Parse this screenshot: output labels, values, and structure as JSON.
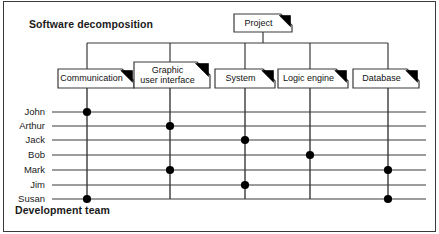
{
  "diagram": {
    "header_title": "Software decomposition",
    "footer_title": "Development team",
    "root": {
      "label": "Project"
    },
    "components": [
      {
        "label": "Communication"
      },
      {
        "label": "Graphic\nuser interface"
      },
      {
        "label": "System"
      },
      {
        "label": "Logic engine"
      },
      {
        "label": "Database"
      }
    ],
    "team": [
      {
        "label": "John"
      },
      {
        "label": "Arthur"
      },
      {
        "label": "Jack"
      },
      {
        "label": "Bob"
      },
      {
        "label": "Mark"
      },
      {
        "label": "Jim"
      },
      {
        "label": "Susan"
      }
    ],
    "assignments": [
      {
        "person": "John",
        "component": "Communication"
      },
      {
        "person": "Arthur",
        "component": "Graphic user interface"
      },
      {
        "person": "Jack",
        "component": "System"
      },
      {
        "person": "Bob",
        "component": "Logic engine"
      },
      {
        "person": "Mark",
        "component": "Graphic user interface"
      },
      {
        "person": "Mark",
        "component": "Database"
      },
      {
        "person": "Jim",
        "component": "System"
      },
      {
        "person": "Susan",
        "component": "Communication"
      },
      {
        "person": "Susan",
        "component": "Database"
      }
    ],
    "colors": {
      "ink": "#1a1a1a",
      "line": "#3a3a3a",
      "dot": "#000000",
      "paper": "#ffffff",
      "fold": "#000000"
    }
  },
  "chart_data": {
    "type": "heatmap",
    "xlabel": "Software decomposition",
    "ylabel": "Development team",
    "categories": [
      "Communication",
      "Graphic user interface",
      "System",
      "Logic engine",
      "Database"
    ],
    "rows": [
      "John",
      "Arthur",
      "Jack",
      "Bob",
      "Mark",
      "Jim",
      "Susan"
    ],
    "grid": true,
    "legend": "none",
    "series": [
      {
        "name": "John",
        "values": [
          1,
          0,
          0,
          0,
          0
        ]
      },
      {
        "name": "Arthur",
        "values": [
          0,
          1,
          0,
          0,
          0
        ]
      },
      {
        "name": "Jack",
        "values": [
          0,
          0,
          1,
          0,
          0
        ]
      },
      {
        "name": "Bob",
        "values": [
          0,
          0,
          0,
          1,
          0
        ]
      },
      {
        "name": "Mark",
        "values": [
          0,
          1,
          0,
          0,
          1
        ]
      },
      {
        "name": "Jim",
        "values": [
          0,
          0,
          1,
          0,
          0
        ]
      },
      {
        "name": "Susan",
        "values": [
          1,
          0,
          0,
          0,
          1
        ]
      }
    ]
  },
  "geometry": {
    "columns_x": [
      87,
      170,
      245,
      310,
      388
    ],
    "rows_y": [
      112,
      126,
      140,
      155,
      170,
      185,
      199
    ],
    "bus_y": 43,
    "row_line_x0": 52,
    "row_line_x1": 426,
    "root_box": {
      "x": 234,
      "y": 14,
      "w": 58,
      "h": 18
    },
    "boxes": [
      {
        "x": 58,
        "y": 69,
        "w": 76,
        "h": 19
      },
      {
        "x": 134,
        "y": 62,
        "w": 76,
        "h": 26
      },
      {
        "x": 215,
        "y": 69,
        "w": 60,
        "h": 19
      },
      {
        "x": 278,
        "y": 69,
        "w": 70,
        "h": 19
      },
      {
        "x": 353,
        "y": 69,
        "w": 66,
        "h": 19
      }
    ]
  }
}
